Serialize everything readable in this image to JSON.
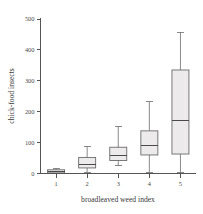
{
  "chart_data": {
    "type": "box",
    "title": "",
    "xlabel": "broadleaved weed index",
    "ylabel": "chick-food insects",
    "categories": [
      "1",
      "2",
      "3",
      "4",
      "5"
    ],
    "ytick_labels": [
      "0",
      "100",
      "200",
      "300",
      "400",
      "500"
    ],
    "ytick_values": [
      0,
      100,
      200,
      300,
      400,
      500
    ],
    "ylim": [
      0,
      500
    ],
    "grid": false,
    "legend": false,
    "boxes": [
      {
        "category": "1",
        "whisker_low": 0,
        "q1": 2,
        "median": 6,
        "q3": 12,
        "whisker_high": 16
      },
      {
        "category": "2",
        "whisker_low": 3,
        "q1": 18,
        "median": 30,
        "q3": 52,
        "whisker_high": 88
      },
      {
        "category": "3",
        "whisker_low": 25,
        "q1": 42,
        "median": 57,
        "q3": 85,
        "whisker_high": 152
      },
      {
        "category": "4",
        "whisker_low": 3,
        "q1": 60,
        "median": 90,
        "q3": 138,
        "whisker_high": 232
      },
      {
        "category": "5",
        "whisker_low": 3,
        "q1": 63,
        "median": 170,
        "q3": 335,
        "whisker_high": 457
      }
    ]
  },
  "colors": {
    "box_fill": "#eceaea",
    "box_stroke": "#6b6b6b",
    "axis": "#555555",
    "text": "#4a4a4a",
    "background": "#ffffff"
  }
}
